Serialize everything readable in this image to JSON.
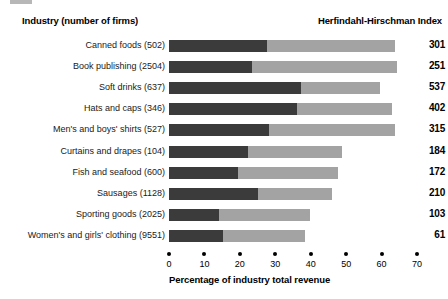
{
  "header": {
    "left_title": "Industry (number of firms)",
    "right_title": "Herfindahl-Hirschman Index"
  },
  "axis": {
    "title": "Percentage of industry total revenue",
    "ticks": [
      "0",
      "10",
      "20",
      "30",
      "40",
      "50",
      "60",
      "70"
    ],
    "min": 0,
    "max": 70,
    "step": 10
  },
  "colors": {
    "four_firm_bar": "#3b3b3b",
    "twenty_firm_bar": "#a3a3a3",
    "text": "#000000",
    "background": "#ffffff"
  },
  "chart_data": {
    "type": "bar",
    "orientation": "horizontal",
    "stacked": false,
    "title": "",
    "xlabel": "Percentage of industry total revenue",
    "ylabel": "Industry (number of firms)",
    "xlim": [
      0,
      70
    ],
    "grid": false,
    "legend_position": "none",
    "categories": [
      "Canned foods (502)",
      "Book publishing  (2504)",
      "Soft drinks (637)",
      "Hats and caps (346)",
      "Men's and boys' shirts (527)",
      "Curtains and drapes (104)",
      "Fish and seafood (600)",
      "Sausages (1128)",
      "Sporting goods (2025)",
      "Women's and girls' clothing (9551)"
    ],
    "series": [
      {
        "name": "four-firm concentration ratio",
        "color": "#3b3b3b",
        "values": [
          27.7,
          23.4,
          37.3,
          36.0,
          28.2,
          22.3,
          19.5,
          25.1,
          14.1,
          15.3
        ]
      },
      {
        "name": "twenty-firm concentration ratio",
        "color": "#a3a3a3",
        "values": [
          63.8,
          64.4,
          59.6,
          63.0,
          63.8,
          48.9,
          47.7,
          46.0,
          39.8,
          38.4
        ]
      }
    ],
    "annotations": {
      "name": "Herfindahl-Hirschman Index",
      "values": [
        301,
        251,
        537,
        402,
        315,
        184,
        172,
        210,
        103,
        61
      ]
    },
    "rows": [
      {
        "label": "Canned foods (502)",
        "four_firm": 27.7,
        "twenty_firm": 63.8,
        "hhi": "301"
      },
      {
        "label": "Book publishing  (2504)",
        "four_firm": 23.4,
        "twenty_firm": 64.4,
        "hhi": "251"
      },
      {
        "label": "Soft drinks (637)",
        "four_firm": 37.3,
        "twenty_firm": 59.6,
        "hhi": "537"
      },
      {
        "label": "Hats and caps (346)",
        "four_firm": 36.0,
        "twenty_firm": 63.0,
        "hhi": "402"
      },
      {
        "label": "Men's and boys' shirts (527)",
        "four_firm": 28.2,
        "twenty_firm": 63.8,
        "hhi": "315"
      },
      {
        "label": "Curtains and drapes (104)",
        "four_firm": 22.3,
        "twenty_firm": 48.9,
        "hhi": "184"
      },
      {
        "label": "Fish and seafood (600)",
        "four_firm": 19.5,
        "twenty_firm": 47.7,
        "hhi": "172"
      },
      {
        "label": "Sausages (1128)",
        "four_firm": 25.1,
        "twenty_firm": 46.0,
        "hhi": "210"
      },
      {
        "label": "Sporting goods (2025)",
        "four_firm": 14.1,
        "twenty_firm": 39.8,
        "hhi": "103"
      },
      {
        "label": "Women's and girls' clothing (9551)",
        "four_firm": 15.3,
        "twenty_firm": 38.4,
        "hhi": "61"
      }
    ]
  }
}
